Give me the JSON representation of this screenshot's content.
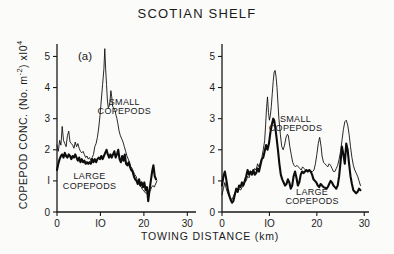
{
  "figure": {
    "title": "SCOTIAN SHELF",
    "y_axis_title_parts": {
      "main": "COPEPOD CONC. (No. m",
      "sup1": "-2",
      "mid": ") xI0",
      "sup2": "4"
    },
    "y_axis_title_plain": "COPEPOD CONC. (No. m-2) xI04",
    "x_axis_title": "TOWING DISTANCE  (km)",
    "panel_tag": "(a)"
  },
  "chart_data": [
    {
      "type": "line",
      "panel": "left",
      "panel_label": "(a)",
      "title": "SCOTIAN SHELF",
      "xlabel": "TOWING DISTANCE (km)",
      "ylabel": "COPEPOD CONC. (No. m-2) xI0^4",
      "xlim": [
        0,
        32
      ],
      "ylim": [
        0,
        5.4
      ],
      "xticks": [
        0,
        10,
        20,
        30
      ],
      "xticklabels": [
        "0",
        "IO",
        "20",
        "30"
      ],
      "yticks": [
        0,
        1,
        2,
        3,
        4,
        5
      ],
      "yticklabels": [
        "0",
        "I",
        "2",
        "3",
        "4",
        "5"
      ],
      "grid": false,
      "legend": "inline-annotations",
      "annotations": [
        {
          "text": "SMALL COPEPODS",
          "x": 15.5,
          "y": 3.45
        },
        {
          "text": "LARGE COPEPODS",
          "x": 7.5,
          "y": 1.05
        }
      ],
      "series": [
        {
          "name": "SMALL COPEPODS",
          "style": "thin",
          "x": [
            0.0,
            0.3,
            0.6,
            0.9,
            1.2,
            1.5,
            1.8,
            2.1,
            2.4,
            2.7,
            3.0,
            3.3,
            3.6,
            3.9,
            4.2,
            4.5,
            4.8,
            5.1,
            5.4,
            5.7,
            6.0,
            6.3,
            6.6,
            6.9,
            7.2,
            7.5,
            7.8,
            8.1,
            8.4,
            8.7,
            9.0,
            9.3,
            9.6,
            9.9,
            10.2,
            10.5,
            10.8,
            11.0,
            11.2,
            11.4,
            11.6,
            11.8,
            12.0,
            12.2,
            12.4,
            12.6,
            12.8,
            13.0,
            13.2,
            13.4,
            13.6,
            13.8,
            14.0,
            14.3,
            14.6,
            14.9,
            15.2,
            15.5,
            15.8,
            16.1,
            16.4,
            16.7,
            17.0,
            17.3,
            17.6,
            17.9,
            18.2,
            18.5,
            18.8,
            19.1,
            19.4,
            19.7,
            20.0,
            20.3,
            20.6,
            20.9,
            21.2,
            21.5,
            21.8,
            22.1,
            22.4,
            22.7,
            23.0
          ],
          "y": [
            2.15,
            1.95,
            2.3,
            2.15,
            2.75,
            2.3,
            2.2,
            2.1,
            2.45,
            2.6,
            2.25,
            2.2,
            2.15,
            2.05,
            2.25,
            2.1,
            2.2,
            2.05,
            1.95,
            1.9,
            1.95,
            1.85,
            1.75,
            1.8,
            1.7,
            1.75,
            1.65,
            1.75,
            1.85,
            2.1,
            2.2,
            2.4,
            2.7,
            3.1,
            3.6,
            4.1,
            4.6,
            5.25,
            4.6,
            4.1,
            3.6,
            3.35,
            3.4,
            3.55,
            3.9,
            3.7,
            3.4,
            3.35,
            3.3,
            3.25,
            3.1,
            3.0,
            2.85,
            2.6,
            2.45,
            2.35,
            2.25,
            2.1,
            1.95,
            1.8,
            1.7,
            1.6,
            1.45,
            1.4,
            1.3,
            1.2,
            1.15,
            1.0,
            0.95,
            0.85,
            0.8,
            0.72,
            0.68,
            0.62,
            0.6,
            0.58,
            0.62,
            0.7,
            0.8,
            0.85,
            0.8,
            0.9,
            1.0
          ]
        },
        {
          "name": "LARGE COPEPODS",
          "style": "thick",
          "x": [
            0.0,
            0.3,
            0.6,
            0.9,
            1.2,
            1.5,
            1.8,
            2.1,
            2.4,
            2.7,
            3.0,
            3.3,
            3.6,
            3.9,
            4.2,
            4.5,
            4.8,
            5.1,
            5.4,
            5.7,
            6.0,
            6.3,
            6.6,
            6.9,
            7.2,
            7.5,
            7.8,
            8.1,
            8.4,
            8.7,
            9.0,
            9.3,
            9.6,
            9.9,
            10.2,
            10.5,
            10.8,
            11.1,
            11.4,
            11.7,
            12.0,
            12.3,
            12.6,
            12.9,
            13.2,
            13.5,
            13.8,
            14.1,
            14.4,
            14.7,
            15.0,
            15.3,
            15.6,
            15.9,
            16.2,
            16.5,
            16.8,
            17.1,
            17.4,
            17.7,
            18.0,
            18.3,
            18.6,
            18.9,
            19.2,
            19.5,
            19.8,
            20.1,
            20.4,
            20.7,
            21.0,
            21.3,
            21.6,
            21.9,
            22.2,
            22.5,
            22.8
          ],
          "y": [
            1.35,
            1.55,
            1.7,
            1.8,
            1.85,
            1.75,
            1.9,
            1.8,
            1.75,
            1.85,
            1.8,
            1.7,
            1.8,
            1.75,
            1.85,
            1.75,
            1.65,
            1.75,
            1.6,
            1.7,
            1.6,
            1.65,
            1.55,
            1.6,
            1.55,
            1.6,
            1.55,
            1.7,
            1.6,
            1.7,
            1.6,
            1.7,
            1.75,
            1.7,
            1.8,
            1.7,
            1.8,
            1.9,
            2.0,
            1.85,
            1.75,
            1.85,
            1.75,
            1.85,
            1.95,
            1.75,
            1.85,
            2.0,
            1.7,
            1.6,
            1.8,
            1.65,
            1.85,
            1.55,
            1.5,
            1.6,
            1.45,
            1.35,
            1.3,
            1.15,
            1.05,
            1.0,
            0.9,
            1.05,
            0.85,
            0.95,
            0.8,
            0.95,
            0.7,
            0.8,
            0.35,
            0.7,
            1.0,
            1.3,
            1.5,
            1.15,
            1.05
          ]
        }
      ]
    },
    {
      "type": "line",
      "panel": "right",
      "panel_label": "",
      "xlabel": "TOWING DISTANCE (km)",
      "ylabel": "COPEPOD CONC. (No. m-2) xI0^4",
      "xlim": [
        0,
        31
      ],
      "ylim": [
        0,
        5.4
      ],
      "xticks": [
        0,
        10,
        20,
        30
      ],
      "xticklabels": [
        "0",
        "IO",
        "20",
        "30"
      ],
      "yticks": [
        0,
        1,
        2,
        3,
        4,
        5
      ],
      "yticklabels": [
        "0",
        "I",
        "2",
        "3",
        "4",
        "5"
      ],
      "grid": false,
      "legend": "inline-annotations",
      "annotations": [
        {
          "text": "SMALL COPEPODS",
          "x": 15.5,
          "y": 2.9
        },
        {
          "text": "LARGE COPEPODS",
          "x": 19.0,
          "y": 0.55
        }
      ],
      "series": [
        {
          "name": "SMALL COPEPODS",
          "style": "thin",
          "x": [
            0.0,
            0.3,
            0.6,
            0.9,
            1.2,
            1.5,
            1.8,
            2.1,
            2.4,
            2.7,
            3.0,
            3.3,
            3.6,
            3.9,
            4.2,
            4.5,
            4.8,
            5.1,
            5.4,
            5.7,
            6.0,
            6.3,
            6.6,
            6.9,
            7.2,
            7.5,
            7.8,
            8.1,
            8.4,
            8.7,
            9.0,
            9.2,
            9.4,
            9.6,
            9.8,
            10.0,
            10.2,
            10.4,
            10.6,
            10.8,
            11.0,
            11.2,
            11.4,
            11.6,
            11.8,
            12.0,
            12.3,
            12.6,
            12.9,
            13.2,
            13.5,
            13.8,
            14.0,
            14.3,
            14.6,
            14.9,
            15.2,
            15.5,
            15.8,
            16.1,
            16.4,
            16.7,
            17.0,
            17.3,
            17.6,
            17.9,
            18.2,
            18.5,
            18.8,
            19.1,
            19.4,
            19.7,
            20.0,
            20.3,
            20.6,
            20.9,
            21.1,
            21.4,
            21.7,
            22.0,
            22.3,
            22.6,
            22.9,
            23.2,
            23.5,
            23.8,
            24.1,
            24.4,
            24.7,
            25.0,
            25.3,
            25.6,
            25.9,
            26.2,
            26.5,
            26.8,
            27.1,
            27.4,
            27.7,
            28.0,
            28.3,
            28.6,
            28.9,
            29.2
          ],
          "y": [
            0.55,
            0.75,
            0.95,
            0.75,
            0.6,
            0.5,
            0.45,
            0.4,
            0.5,
            0.62,
            0.7,
            0.62,
            0.75,
            0.7,
            0.78,
            0.85,
            0.95,
            1.0,
            1.15,
            1.1,
            1.25,
            1.2,
            1.3,
            1.4,
            1.35,
            1.55,
            1.45,
            1.6,
            1.75,
            2.0,
            2.3,
            2.8,
            3.35,
            3.7,
            3.2,
            2.95,
            3.1,
            3.4,
            3.8,
            4.2,
            4.5,
            4.55,
            4.35,
            4.0,
            3.5,
            3.0,
            2.5,
            2.1,
            2.0,
            2.15,
            2.4,
            2.5,
            2.45,
            2.1,
            1.85,
            1.6,
            1.5,
            1.45,
            1.5,
            1.45,
            1.4,
            1.35,
            1.45,
            1.4,
            1.35,
            1.3,
            1.3,
            1.35,
            1.3,
            1.3,
            1.35,
            1.55,
            1.85,
            2.2,
            2.4,
            2.1,
            1.8,
            1.6,
            1.55,
            1.5,
            1.45,
            1.55,
            1.5,
            1.4,
            1.3,
            1.3,
            1.4,
            1.5,
            1.7,
            1.95,
            2.3,
            2.65,
            2.9,
            2.95,
            2.8,
            2.5,
            2.1,
            1.75,
            1.5,
            1.35,
            1.25,
            1.15,
            1.0,
            0.85
          ]
        },
        {
          "name": "LARGE COPEPODS",
          "style": "thick",
          "x": [
            0.0,
            0.3,
            0.6,
            0.9,
            1.2,
            1.5,
            1.8,
            2.1,
            2.4,
            2.7,
            3.0,
            3.3,
            3.6,
            3.9,
            4.2,
            4.5,
            4.8,
            5.1,
            5.4,
            5.7,
            6.0,
            6.3,
            6.6,
            6.9,
            7.2,
            7.5,
            7.8,
            8.1,
            8.4,
            8.7,
            9.0,
            9.3,
            9.6,
            9.9,
            10.2,
            10.5,
            10.8,
            11.0,
            11.2,
            11.5,
            11.8,
            12.1,
            12.4,
            12.7,
            13.0,
            13.3,
            13.6,
            13.9,
            14.2,
            14.5,
            14.8,
            15.1,
            15.4,
            15.7,
            16.0,
            16.3,
            16.6,
            16.9,
            17.2,
            17.5,
            17.8,
            18.1,
            18.4,
            18.7,
            19.0,
            19.3,
            19.6,
            19.9,
            20.2,
            20.5,
            20.8,
            21.1,
            21.4,
            21.7,
            22.0,
            22.3,
            22.6,
            22.9,
            23.2,
            23.5,
            23.8,
            24.1,
            24.4,
            24.7,
            25.0,
            25.3,
            25.6,
            25.9,
            26.2,
            26.5,
            26.8,
            27.1,
            27.4,
            27.7,
            28.0,
            28.3,
            28.6,
            28.9,
            29.2
          ],
          "y": [
            0.85,
            1.15,
            1.3,
            1.05,
            0.75,
            0.55,
            0.4,
            0.3,
            0.35,
            0.55,
            0.75,
            0.65,
            0.85,
            0.8,
            0.95,
            0.85,
            1.0,
            1.15,
            1.35,
            1.2,
            1.3,
            1.2,
            1.35,
            1.2,
            1.25,
            1.4,
            1.3,
            1.5,
            1.7,
            1.75,
            1.95,
            2.15,
            2.0,
            2.2,
            2.55,
            2.8,
            3.0,
            2.95,
            2.75,
            2.4,
            2.0,
            1.55,
            1.2,
            1.05,
            0.95,
            0.85,
            0.9,
            1.05,
            0.95,
            0.75,
            0.85,
            1.15,
            1.3,
            1.1,
            0.85,
            0.95,
            1.2,
            1.3,
            1.25,
            1.3,
            1.35,
            1.3,
            1.35,
            1.3,
            1.2,
            1.05,
            1.0,
            0.95,
            0.85,
            0.8,
            0.9,
            0.85,
            0.8,
            0.78,
            0.75,
            0.8,
            0.9,
            1.0,
            0.95,
            0.85,
            0.8,
            0.75,
            0.85,
            1.15,
            1.6,
            2.1,
            1.85,
            1.55,
            2.2,
            2.0,
            1.55,
            1.15,
            0.9,
            0.7,
            0.65,
            0.6,
            0.65,
            0.75,
            0.7
          ]
        }
      ]
    }
  ]
}
